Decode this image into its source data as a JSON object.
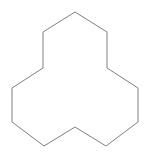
{
  "canvas": {
    "width": 148,
    "height": 159,
    "background_color": "#ffffff",
    "title": "Geometric polygon figure"
  },
  "figure": {
    "name": "tri-lobed-dodecagon",
    "side_count": 12,
    "stroke_color": "#808080",
    "fill_color": "#ffffff",
    "stroke_width": 1,
    "closed": true,
    "vertices": [
      [
        75,
        12
      ],
      [
        107,
        32
      ],
      [
        107,
        68
      ],
      [
        138,
        88
      ],
      [
        138,
        122
      ],
      [
        106,
        146
      ],
      [
        75,
        127
      ],
      [
        44,
        146
      ],
      [
        12,
        122
      ],
      [
        12,
        88
      ],
      [
        43,
        68
      ],
      [
        43,
        32
      ]
    ],
    "points_attr": "75,12 107,32 107,68 138,88 138,122 106,146 75,127 44,146 12,122 12,88 43,68 43,32"
  }
}
